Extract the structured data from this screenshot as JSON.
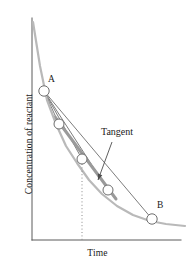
{
  "chart_data": {
    "type": "line",
    "title": "",
    "xlabel": "Time",
    "ylabel": "Concentration of reactant",
    "grid": false,
    "legend": null,
    "axis": {
      "x_axis_y": 240,
      "y_axis_x": 32,
      "x_start": 32,
      "x_end": 181,
      "y_top": 18,
      "y_bottom": 240,
      "ticks": [],
      "tick_labels": []
    },
    "curve": {
      "name": "concentration decay curve",
      "color": "#b9b9b9",
      "width": 2.2,
      "points": [
        [
          33,
          22
        ],
        [
          40,
          66
        ],
        [
          47,
          100
        ],
        [
          56,
          124
        ],
        [
          66,
          146
        ],
        [
          77,
          163
        ],
        [
          89,
          180
        ],
        [
          102,
          194
        ],
        [
          117,
          206
        ],
        [
          133,
          215
        ],
        [
          150,
          221
        ],
        [
          166,
          224
        ],
        [
          185,
          226
        ]
      ]
    },
    "markers": [
      {
        "id": "A",
        "label": "A",
        "x": 44,
        "y": 91,
        "r": 5.2
      },
      {
        "id": "P2",
        "label": "",
        "x": 59,
        "y": 124,
        "r": 5.0
      },
      {
        "id": "P3",
        "label": "",
        "x": 82,
        "y": 159,
        "r": 5.0
      },
      {
        "id": "P4",
        "label": "",
        "x": 108,
        "y": 190,
        "r": 5.0
      },
      {
        "id": "B",
        "label": "B",
        "x": 152,
        "y": 219,
        "r": 5.2
      }
    ],
    "secants": [
      {
        "name": "chord-A-to-B",
        "from": [
          44,
          91
        ],
        "to": [
          152,
          219
        ],
        "color": "#7d7d7d",
        "width": 1.0
      },
      {
        "name": "secant-A-to-P4",
        "from": [
          44,
          91
        ],
        "to": [
          108,
          190
        ],
        "color": "#7d7d7d",
        "width": 1.0
      },
      {
        "name": "secant-A-to-P3",
        "from": [
          44,
          91
        ],
        "to": [
          82,
          159
        ],
        "color": "#7d7d7d",
        "width": 1.0
      },
      {
        "name": "secant-A-to-P2",
        "from": [
          44,
          91
        ],
        "to": [
          59,
          124
        ],
        "color": "#7d7d7d",
        "width": 1.0
      }
    ],
    "tangent": {
      "name": "tangent-line",
      "label": "Tangent",
      "from": [
        55,
        117
      ],
      "to": [
        116,
        199
      ],
      "color": "#9a9a9a",
      "width": 3.0
    },
    "leader": {
      "name": "tangent-leader-line",
      "from": [
        112,
        142
      ],
      "to": [
        98,
        180
      ],
      "color": "#4d4d4d",
      "width": 0.9
    },
    "dropline": {
      "name": "dotted-dropline",
      "x": 82,
      "from_y": 164,
      "to_y": 240,
      "color": "#8a8a8a",
      "width": 1.0,
      "dash": "1,2.4"
    },
    "colors": {
      "axis": "#5a5a5a",
      "curve": "#b9b9b9",
      "secant": "#7d7d7d",
      "tangent": "#9a9a9a",
      "marker_fill": "#ffffff",
      "marker_stroke": "#6e6e6e",
      "text": "#1a1a1a",
      "background": "#ffffff"
    }
  },
  "figure": {
    "xlabel": "Time",
    "ylabel": "Concentration of reactant",
    "tangent_label": "Tangent",
    "label_a": "A",
    "label_b": "B"
  }
}
